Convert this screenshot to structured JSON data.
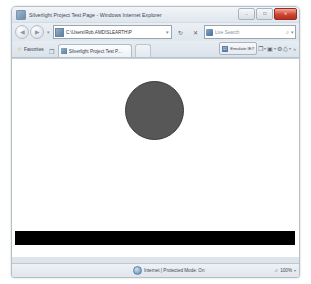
{
  "window": {
    "title": "Silverlight Project Test Page - Windows Internet Explorer",
    "icon": "ie-page-icon",
    "controls": {
      "minimize": "–",
      "maximize": "☐",
      "close": "✕"
    }
  },
  "navbar": {
    "back_glyph": "◀",
    "forward_glyph": "▶",
    "history_caret": "▾",
    "address": {
      "favicon": "page-favicon",
      "url": "C:\\Users\\Rob.AMD\\SLEARTH\\P",
      "dropdown_caret": "▾"
    },
    "refresh_glyph": "↻",
    "stop_glyph": "✕",
    "search": {
      "engine_icon": "live-search-icon",
      "placeholder": "Live Search",
      "go_glyph": "⌕",
      "caret": "▾"
    }
  },
  "tabbar": {
    "favorites": {
      "star_glyph": "☆",
      "label": "Favorites",
      "add_glyph": "❐"
    },
    "tabs": [
      {
        "favicon": "page-favicon",
        "label": "Silverlight Project Test P..."
      }
    ],
    "emulate": {
      "icon_glyph": "☑",
      "label": "Emulate IE7"
    },
    "tools": [
      {
        "name": "page-menu",
        "glyph": "❐",
        "caret": "▾"
      },
      {
        "name": "safety-menu",
        "glyph": "▣",
        "caret": "▾"
      },
      {
        "name": "tools-menu",
        "glyph": "⚙",
        "caret": ""
      },
      {
        "name": "print-menu",
        "glyph": "⎙",
        "caret": "▾"
      }
    ],
    "overflow_chevron": "»"
  },
  "content": {
    "description": "silverlight-plugin-surface",
    "ellipse": {
      "name": "silverlight-ellipse",
      "fill": "#575757",
      "stroke": "#3a3a3a"
    },
    "bar": {
      "name": "silverlight-black-bar",
      "fill": "#000000"
    }
  },
  "statusbar": {
    "zone_icon": "internet-zone-icon",
    "zone_text": "Internet | Protected Mode: On",
    "zoom_glyph": "⌕",
    "zoom_level": "100%",
    "zoom_caret": "▾"
  }
}
